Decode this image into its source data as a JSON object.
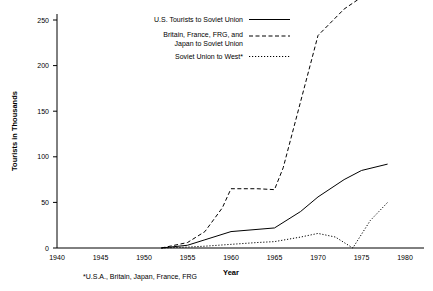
{
  "chart_data": {
    "type": "line",
    "title": "",
    "xlabel": "Year",
    "ylabel": "Tourists in Thousands",
    "xlim": [
      1940,
      1980
    ],
    "ylim": [
      0,
      265
    ],
    "xticks": [
      1940,
      1945,
      1950,
      1955,
      1960,
      1965,
      1970,
      1975,
      1980
    ],
    "yticks": [
      0,
      50,
      100,
      150,
      200,
      250
    ],
    "grid": false,
    "legend_position": "top-center",
    "footnote": "*U.S.A., Britain, Japan, France, FRG",
    "series": [
      {
        "name": "U.S. Tourists to Soviet Union",
        "style": "solid",
        "x": [
          1952,
          1953,
          1955,
          1957,
          1960,
          1965,
          1968,
          1970,
          1973,
          1975,
          1978
        ],
        "values": [
          0,
          1,
          3,
          9,
          18,
          22,
          40,
          56,
          75,
          85,
          92
        ]
      },
      {
        "name": "Britain, France, FRG, and Japan to Soviet Union",
        "style": "dashed",
        "x": [
          1952,
          1953,
          1955,
          1957,
          1959,
          1960,
          1963,
          1965,
          1966,
          1970,
          1973,
          1975
        ],
        "values": [
          0,
          2,
          6,
          18,
          44,
          65,
          65,
          64,
          88,
          233,
          262,
          275
        ]
      },
      {
        "name": "Soviet Union to West*",
        "style": "dotted",
        "x": [
          1952,
          1955,
          1957,
          1960,
          1963,
          1965,
          1968,
          1970,
          1972,
          1974,
          1976,
          1978
        ],
        "values": [
          0,
          1,
          2,
          4,
          6,
          7,
          12,
          16,
          12,
          0,
          30,
          50
        ]
      }
    ]
  },
  "axis": {
    "x_title": "Year",
    "y_title": "Tourists in Thousands"
  },
  "legend": {
    "items": [
      {
        "label_line1": "U.S. Tourists to Soviet Union",
        "label_line2": "",
        "style": "solid"
      },
      {
        "label_line1": "Britain, France, FRG, and",
        "label_line2": "Japan to Soviet Union",
        "style": "dashed"
      },
      {
        "label_line1": "Soviet Union to West*",
        "label_line2": "",
        "style": "dotted"
      }
    ]
  },
  "footnote": {
    "text": "*U.S.A., Britain, Japan, France, FRG"
  }
}
